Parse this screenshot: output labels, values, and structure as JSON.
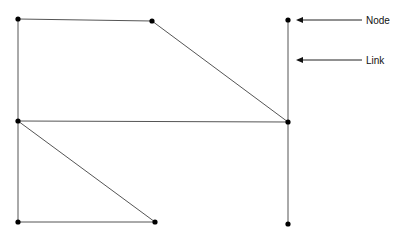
{
  "diagram": {
    "type": "network-graph",
    "nodes": [
      {
        "id": "n1",
        "x": 18,
        "y": 19
      },
      {
        "id": "n2",
        "x": 152,
        "y": 21
      },
      {
        "id": "n3",
        "x": 288,
        "y": 20
      },
      {
        "id": "n4",
        "x": 18,
        "y": 121
      },
      {
        "id": "n5",
        "x": 288,
        "y": 122
      },
      {
        "id": "n6",
        "x": 18,
        "y": 222
      },
      {
        "id": "n7",
        "x": 155,
        "y": 222
      },
      {
        "id": "n8",
        "x": 288,
        "y": 224
      }
    ],
    "links": [
      [
        "n1",
        "n2"
      ],
      [
        "n2",
        "n5"
      ],
      [
        "n1",
        "n4"
      ],
      [
        "n4",
        "n5"
      ],
      [
        "n3",
        "n5"
      ],
      [
        "n5",
        "n8"
      ],
      [
        "n4",
        "n6"
      ],
      [
        "n4",
        "n7"
      ],
      [
        "n6",
        "n7"
      ]
    ],
    "annotations": [
      {
        "label": "Node",
        "arrow_from": [
          362,
          20
        ],
        "arrow_to": [
          296,
          20
        ],
        "text_x": 366,
        "text_y": 24
      },
      {
        "label": "Link",
        "arrow_from": [
          362,
          60
        ],
        "arrow_to": [
          296,
          60
        ],
        "text_x": 366,
        "text_y": 64
      }
    ],
    "colors": {
      "line": "#555555",
      "node": "#000000",
      "text": "#111111"
    }
  }
}
